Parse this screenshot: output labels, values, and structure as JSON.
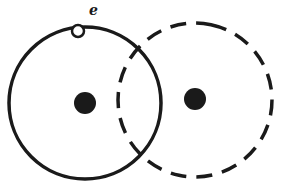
{
  "diagram": {
    "electron_label": "e",
    "colors": {
      "ink": "#1a1a1a",
      "background": "#ffffff"
    },
    "atom_a": {
      "orbit_style": "solid",
      "center": [
        85,
        103
      ],
      "radius": 76,
      "nucleus_radius": 11
    },
    "atom_b": {
      "orbit_style": "dashed",
      "center": [
        195,
        100
      ],
      "radius": 77,
      "nucleus_radius": 11
    },
    "electron": {
      "position": [
        78,
        31
      ],
      "radius": 6
    }
  }
}
